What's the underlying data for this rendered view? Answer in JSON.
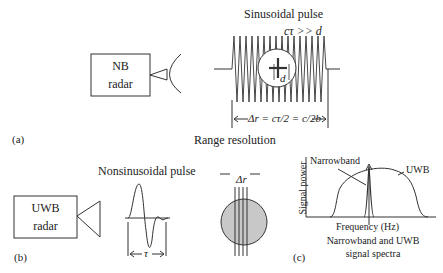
{
  "panel_a": {
    "tag": "(a)",
    "radar_line1": "NB",
    "radar_line2": "radar",
    "pulse_title": "Sinusoidal pulse",
    "condition": "cτ >> d",
    "target_label": "d",
    "resolution_eq": "Δr = cτ/2 = c/2b",
    "caption": "Range resolution"
  },
  "panel_b": {
    "tag": "(b)",
    "radar_line1": "UWB",
    "radar_line2": "radar",
    "pulse_title": "Nonsinusoidal pulse",
    "pulse_width_label": "τ",
    "target_label": "Δr"
  },
  "panel_c": {
    "tag": "(c)",
    "ylabel": "Signal power",
    "xlabel": "Frequency (Hz)",
    "narrowband_label": "Narrowband",
    "uwb_label": "UWB",
    "caption_line1": "Narrowband and UWB",
    "caption_line2": "signal spectra"
  }
}
